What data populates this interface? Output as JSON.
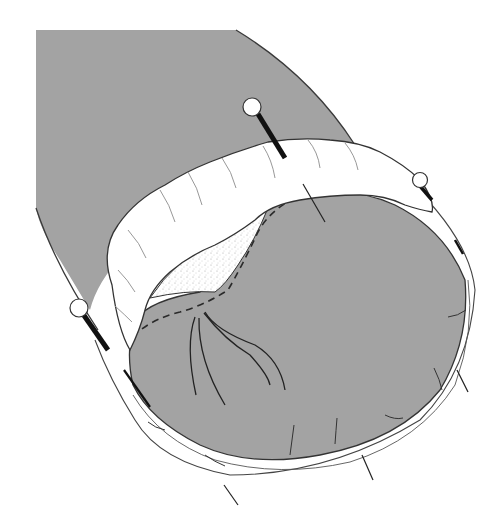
{
  "figure": {
    "kind": "surgical anatomical illustration",
    "colors": {
      "background": "#ffffff",
      "tissue_gray": "#a3a3a3",
      "outline": "#3a3a3a",
      "bowel_white": "#ffffff",
      "stipple": "#b9b9b9",
      "pin": "#111111"
    },
    "pins": [
      {
        "id": "pin-top",
        "head": [
          254,
          107
        ]
      },
      {
        "id": "pin-right",
        "head": [
          420,
          181
        ]
      },
      {
        "id": "pin-left",
        "head": [
          79,
          308
        ]
      }
    ],
    "text": []
  }
}
